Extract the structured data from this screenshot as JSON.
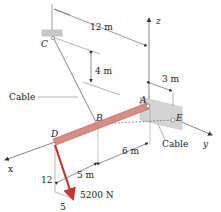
{
  "diagram": {
    "points": {
      "A": "A",
      "B": "B",
      "C": "C",
      "D": "D",
      "E": "E"
    },
    "axes": {
      "x": "x",
      "y": "y",
      "z": "z"
    },
    "dimensions": {
      "dim_12m": "12 m",
      "dim_4m": "4 m",
      "dim_3m": "3 m",
      "dim_6m": "6 m",
      "dim_5m": "5 m"
    },
    "labels": {
      "cable_left": "Cable",
      "cable_right": "Cable"
    },
    "force": {
      "magnitude": "5200 N",
      "slope_vertical": "12",
      "slope_horizontal": "5"
    },
    "colors": {
      "boom": "#d98b84",
      "boom_edge": "#b55a52",
      "force": "#c0392b",
      "wall": "#cfcfcf",
      "line": "#555555"
    }
  }
}
